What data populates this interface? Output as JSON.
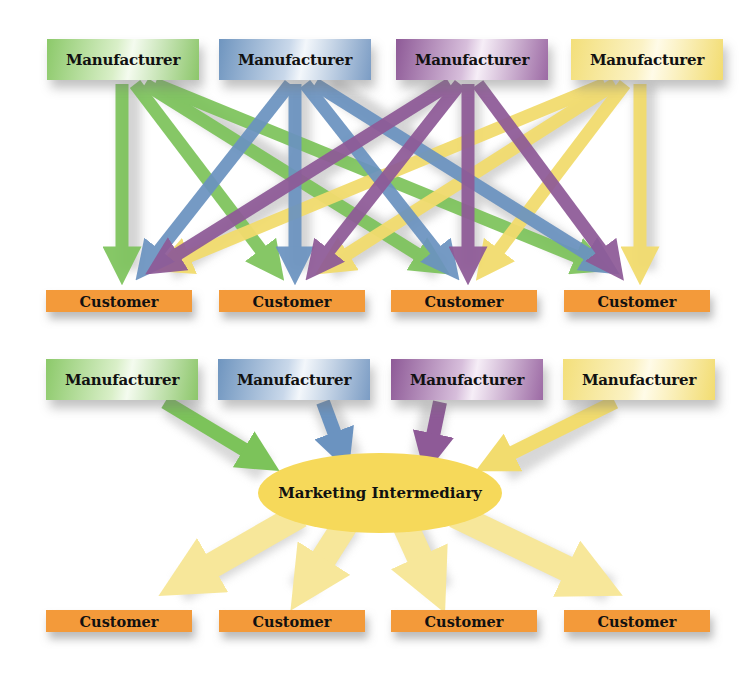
{
  "colors": {
    "green": "#7cc35a",
    "blue": "#6b93c0",
    "purple": "#8e5a97",
    "yellow": "#f2dc6e",
    "customer_orange": "#f39a3a",
    "intermediary_yellow": "#f6d95a"
  },
  "top_diagram": {
    "manufacturers": [
      {
        "label": "Manufacturer",
        "color": "green"
      },
      {
        "label": "Manufacturer",
        "color": "blue"
      },
      {
        "label": "Manufacturer",
        "color": "purple"
      },
      {
        "label": "Manufacturer",
        "color": "yellow"
      }
    ],
    "customers": [
      {
        "label": "Customer"
      },
      {
        "label": "Customer"
      },
      {
        "label": "Customer"
      },
      {
        "label": "Customer"
      }
    ],
    "connections": "each manufacturer connects directly to each of the 4 customers (16 arrows)"
  },
  "bottom_diagram": {
    "manufacturers": [
      {
        "label": "Manufacturer",
        "color": "green"
      },
      {
        "label": "Manufacturer",
        "color": "blue"
      },
      {
        "label": "Manufacturer",
        "color": "purple"
      },
      {
        "label": "Manufacturer",
        "color": "yellow"
      }
    ],
    "intermediary": {
      "label": "Marketing Intermediary"
    },
    "customers": [
      {
        "label": "Customer"
      },
      {
        "label": "Customer"
      },
      {
        "label": "Customer"
      },
      {
        "label": "Customer"
      }
    ],
    "connections": "4 manufacturers -> marketing intermediary -> 4 customers (8 arrows)"
  }
}
